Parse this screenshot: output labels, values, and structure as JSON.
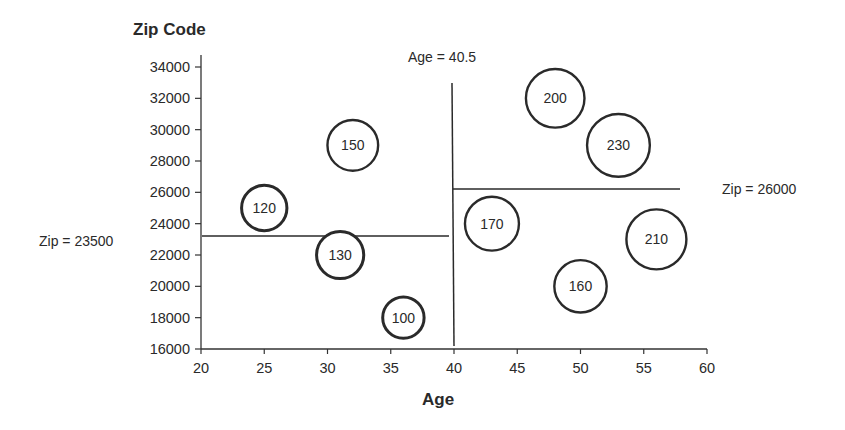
{
  "chart_data": {
    "type": "scatter",
    "subtype": "bubble",
    "title": "",
    "xlabel": "Age",
    "ylabel": "Zip Code",
    "xlim": [
      20,
      60
    ],
    "ylim": [
      16000,
      34000
    ],
    "x_ticks": [
      20,
      25,
      30,
      35,
      40,
      45,
      50,
      55,
      60
    ],
    "y_ticks": [
      16000,
      18000,
      20000,
      22000,
      24000,
      26000,
      28000,
      30000,
      32000,
      34000
    ],
    "grid": false,
    "legend": null,
    "points": [
      {
        "label": "120",
        "x": 25,
        "y": 25000,
        "size": 120
      },
      {
        "label": "150",
        "x": 32,
        "y": 29000,
        "size": 150
      },
      {
        "label": "130",
        "x": 31,
        "y": 22000,
        "size": 130
      },
      {
        "label": "100",
        "x": 36,
        "y": 18000,
        "size": 100
      },
      {
        "label": "200",
        "x": 48,
        "y": 32000,
        "size": 200
      },
      {
        "label": "230",
        "x": 53,
        "y": 29000,
        "size": 230
      },
      {
        "label": "170",
        "x": 43,
        "y": 24000,
        "size": 170
      },
      {
        "label": "210",
        "x": 56,
        "y": 23000,
        "size": 210
      },
      {
        "label": "160",
        "x": 50,
        "y": 20000,
        "size": 160
      }
    ],
    "annotations": [
      {
        "text": "Age = 40.5",
        "type": "vertical-split",
        "x": 40.5
      },
      {
        "text": "Zip = 23500",
        "type": "horizontal-split",
        "y": 23500,
        "range": "left of Age = 40.5"
      },
      {
        "text": "Zip = 26000",
        "type": "horizontal-split",
        "y": 26000,
        "range": "right of Age = 40.5"
      }
    ]
  },
  "labels": {
    "y_axis_title": "Zip Code",
    "x_axis_title": "Age",
    "split_age": "Age = 40.5",
    "split_zip_left": "Zip = 23500",
    "split_zip_right": "Zip = 26000"
  }
}
